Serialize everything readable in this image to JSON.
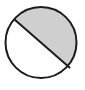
{
  "figure": {
    "name": "shaded-circle-segment",
    "canvas": {
      "width": 85,
      "height": 90,
      "background_color": "#ffffff"
    },
    "circle": {
      "center_x": 41,
      "center_y": 42.5,
      "radius": 35.5,
      "stroke_color": "#1c1c1c",
      "stroke_width": 2,
      "fill_color": "#ffffff"
    },
    "chord": {
      "x1": 14.5,
      "y1": 19.5,
      "x2": 69.5,
      "y2": 67.5,
      "stroke_color": "#1c1c1c",
      "stroke_width": 2
    },
    "shaded_region": {
      "label": "upper-right-segment",
      "fill_color": "#cfcfcf",
      "position": "above-chord"
    },
    "unshaded_region": {
      "label": "lower-left-segment",
      "fill_color": "#ffffff",
      "position": "below-chord"
    }
  }
}
